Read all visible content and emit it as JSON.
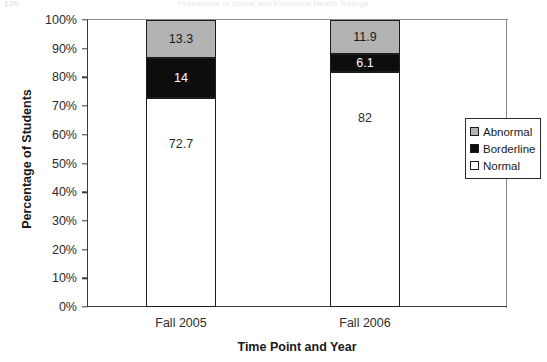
{
  "header": {
    "page_number": "120",
    "running_title": "Prevalence of Social and Emotional Health Ratings"
  },
  "chart_data": {
    "type": "bar",
    "subtype": "100% stacked column",
    "title": "",
    "xlabel": "Time Point and Year",
    "ylabel": "Percentage of Students",
    "categories": [
      "Fall 2005",
      "Fall 2006"
    ],
    "ylim": [
      0,
      100
    ],
    "ytick_labels": [
      "0%",
      "10%",
      "20%",
      "30%",
      "40%",
      "50%",
      "60%",
      "70%",
      "80%",
      "90%",
      "100%"
    ],
    "ytick_values": [
      0,
      10,
      20,
      30,
      40,
      50,
      60,
      70,
      80,
      90,
      100
    ],
    "grid": false,
    "legend_position": "right-middle",
    "series": [
      {
        "name": "Abnormal",
        "color": "#b3b3b3",
        "values": [
          13.3,
          11.9
        ],
        "labels": [
          "13.3",
          "11.9"
        ]
      },
      {
        "name": "Borderline",
        "color": "#0d0d0d",
        "values": [
          14,
          6.1
        ],
        "labels": [
          "14",
          "6.1"
        ]
      },
      {
        "name": "Normal",
        "color": "#ffffff",
        "values": [
          72.7,
          82
        ],
        "labels": [
          "72.7",
          "82"
        ]
      }
    ]
  },
  "legend": {
    "items": [
      {
        "label": "Abnormal",
        "color": "#b3b3b3"
      },
      {
        "label": "Borderline",
        "color": "#0d0d0d"
      },
      {
        "label": "Normal",
        "color": "#ffffff"
      }
    ]
  }
}
